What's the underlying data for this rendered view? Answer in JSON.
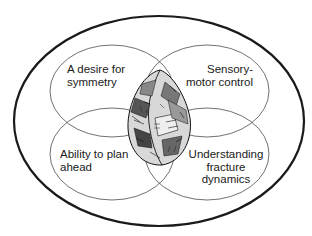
{
  "diagram": {
    "type": "venn",
    "outer_boundary": "single enclosing ellipse",
    "center_image": "flaked-stone-hand-axe",
    "circles": [
      {
        "position": "top-left",
        "lines": [
          "A desire for",
          "symmetry"
        ]
      },
      {
        "position": "top-right",
        "lines": [
          "Sensory-",
          "motor control"
        ]
      },
      {
        "position": "bottom-left",
        "lines": [
          "Ability to plan",
          "ahead"
        ]
      },
      {
        "position": "bottom-right",
        "lines": [
          "Understanding",
          "fracture",
          "dynamics"
        ]
      }
    ],
    "colors": {
      "stroke": "#1a1a1a",
      "background": "#ffffff"
    }
  }
}
